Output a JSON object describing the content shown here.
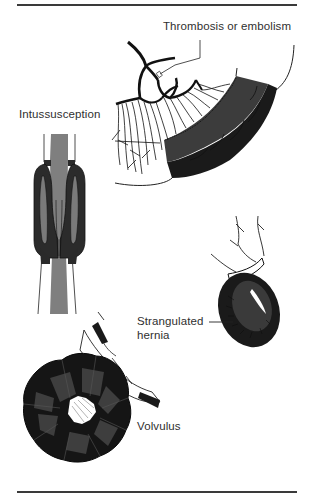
{
  "figure": {
    "labels": {
      "thrombosis": "Thrombosis or embolism",
      "intussusception": "Intussusception",
      "strangulated_hernia_line1": "Strangulated",
      "strangulated_hernia_line2": "hernia",
      "volvulus": "Volvulus"
    },
    "colors": {
      "rule": "#3a3a3a",
      "ischemic_dark": "#1c1c1c",
      "ischemic_mid": "#3c3c3c",
      "bowel_gray": "#7d7d7d",
      "vessel": "#111111",
      "background": "#ffffff"
    }
  }
}
